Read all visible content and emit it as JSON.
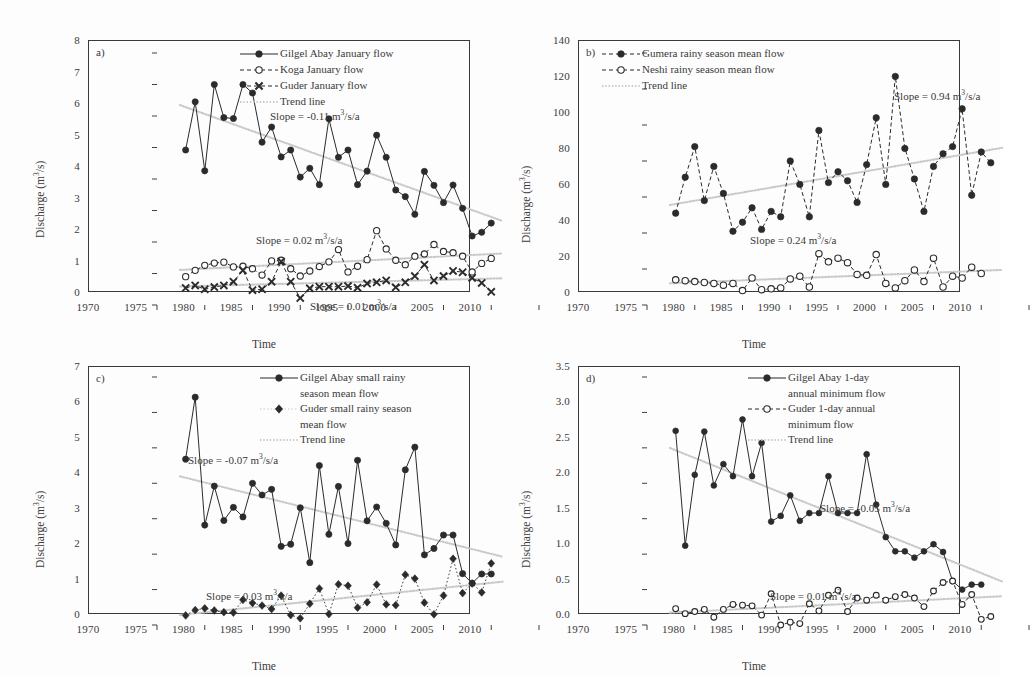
{
  "figure": {
    "background": "#ffffff",
    "ink": "#2b2b2b",
    "trend_color": "#c9c9c9"
  },
  "axis": {
    "xlabel": "Time",
    "ylabel": "Discharge (m3/s)",
    "ylabel_base": "Discharge (m",
    "ylabel_sup": "3",
    "ylabel_tail": "/s)",
    "xticks": [
      "1970",
      "1975",
      "1980",
      "1985",
      "1990",
      "1995",
      "2000",
      "2005",
      "2010"
    ],
    "xlim": [
      1970,
      2010
    ]
  },
  "panels": [
    {
      "id": "a",
      "letter": "a)",
      "ylim": [
        0,
        8
      ],
      "yticks": [
        "0",
        "1",
        "2",
        "3",
        "4",
        "5",
        "6",
        "7",
        "8"
      ],
      "legend": [
        {
          "label": "Gilgel Abay January flow",
          "key": "solid-filled-circle"
        },
        {
          "label": "Koga January flow",
          "key": "dashed-open-circle"
        },
        {
          "label": "Guder January flow",
          "key": "dashed-cross"
        },
        {
          "label": "Trend line",
          "key": "dotted-grey-line"
        }
      ],
      "annotations": [
        {
          "prefix": "Slope = -0.11 m",
          "sup": "3",
          "suffix": "/s/a",
          "x": 182,
          "y": 68
        },
        {
          "prefix": "Slope = 0.02 m",
          "sup": "3",
          "suffix": "/s/a",
          "x": 168,
          "y": 192
        },
        {
          "prefix": "Slope = 0.01 m",
          "sup": "3",
          "suffix": "/s/a",
          "x": 222,
          "y": 258
        }
      ]
    },
    {
      "id": "b",
      "letter": "b)",
      "ylim": [
        0,
        140
      ],
      "yticks": [
        "0",
        "20",
        "40",
        "60",
        "80",
        "100",
        "120",
        "140"
      ],
      "legend": [
        {
          "label": "Gumera rainy season mean flow",
          "key": "dashed-filled-circle"
        },
        {
          "label": "Neshi rainy season mean flow",
          "key": "dashed-open-circle"
        },
        {
          "label": "Trend line",
          "key": "dotted-grey-line"
        }
      ],
      "annotations": [
        {
          "prefix": "Slope = 0.94 m",
          "sup": "3",
          "suffix": "/s/a",
          "x": 316,
          "y": 48
        },
        {
          "prefix": "Slope = 0.24 m",
          "sup": "3",
          "suffix": "/s/a",
          "x": 172,
          "y": 192
        }
      ]
    },
    {
      "id": "c",
      "letter": "c)",
      "ylim": [
        0,
        7
      ],
      "yticks": [
        "0",
        "1",
        "2",
        "3",
        "4",
        "5",
        "6",
        "7"
      ],
      "legend": [
        {
          "label": "Gilgel Abay small rainy",
          "label2": "season mean flow",
          "key": "solid-filled-circle"
        },
        {
          "label": "Guder small rainy season",
          "label2": "mean flow",
          "key": "dotted-filled-diamond"
        },
        {
          "label": "Trend line",
          "key": "dotted-grey-line"
        }
      ],
      "annotations": [
        {
          "prefix": "Slope = -0.07 m",
          "sup": "3",
          "suffix": "/s/a",
          "x": 100,
          "y": 86
        },
        {
          "prefix": "Slope = 0.03 m",
          "sup": "3",
          "suffix": "/s/a",
          "x": 118,
          "y": 222
        }
      ]
    },
    {
      "id": "d",
      "letter": "d)",
      "ylim": [
        0,
        3.5
      ],
      "yticks": [
        "0.0",
        "0.5",
        "1.0",
        "1.5",
        "2.0",
        "2.5",
        "3.0",
        "3.5"
      ],
      "legend": [
        {
          "label": "Gilgel Abay 1-day",
          "label2": "annual minimum flow",
          "key": "solid-filled-circle"
        },
        {
          "label": "Guder 1-day annual",
          "label2": "minimum flow",
          "key": "dashed-open-circle"
        },
        {
          "label": "Trend line",
          "key": "dotted-grey-line"
        }
      ],
      "annotations": [
        {
          "prefix": "Slope = -0.05 m",
          "sup": "3",
          "suffix": "/s/a",
          "x": 242,
          "y": 134
        },
        {
          "prefix": "Slope = 0.01 m",
          "sup": "3",
          "suffix": "/s/a",
          "x": 192,
          "y": 222
        }
      ]
    }
  ],
  "chart_data": [
    {
      "panel": "a",
      "type": "line",
      "title": "a) January flow",
      "xlabel": "Time",
      "ylabel": "Discharge (m3/s)",
      "xlim": [
        1970,
        2010
      ],
      "ylim": [
        0,
        8
      ],
      "grid": false,
      "legend_position": "top-right",
      "x": [
        1973,
        1974,
        1975,
        1976,
        1977,
        1978,
        1979,
        1980,
        1981,
        1982,
        1983,
        1984,
        1985,
        1986,
        1987,
        1988,
        1989,
        1990,
        1991,
        1992,
        1993,
        1994,
        1995,
        1996,
        1997,
        1998,
        1999,
        2000,
        2001,
        2002,
        2003,
        2004,
        2005
      ],
      "series": [
        {
          "name": "Gilgel Abay January flow",
          "marker": "filled-circle",
          "line": "solid",
          "values": [
            4.92,
            6.45,
            4.26,
            7.0,
            5.95,
            5.92,
            7.0,
            6.73,
            5.17,
            5.65,
            4.7,
            4.92,
            4.06,
            4.34,
            3.82,
            5.91,
            4.69,
            4.92,
            3.82,
            4.25,
            5.39,
            4.69,
            3.65,
            3.44,
            2.88,
            4.24,
            3.8,
            3.25,
            3.81,
            3.07,
            2.19,
            2.31,
            2.6
          ],
          "trend_slope": -0.11,
          "trend_label": "Slope = -0.11 m3/s/a"
        },
        {
          "name": "Koga January flow",
          "marker": "open-circle",
          "line": "dashed",
          "values": [
            0.9,
            1.1,
            1.26,
            1.33,
            1.36,
            1.21,
            1.23,
            1.15,
            0.95,
            1.4,
            1.42,
            1.15,
            0.92,
            1.08,
            1.22,
            1.37,
            1.76,
            1.05,
            1.23,
            1.44,
            2.36,
            1.78,
            1.42,
            1.28,
            1.55,
            1.62,
            1.92,
            1.7,
            1.66,
            1.55,
            1.05,
            1.32,
            1.48
          ],
          "trend_slope": 0.02,
          "trend_label": "Slope = 0.02 m3/s/a"
        },
        {
          "name": "Guder January flow",
          "marker": "cross",
          "line": "dashed",
          "values": [
            0.54,
            0.62,
            0.5,
            0.57,
            0.62,
            0.74,
            1.1,
            0.47,
            0.5,
            0.74,
            1.38,
            0.74,
            0.22,
            0.53,
            0.58,
            0.58,
            0.58,
            0.6,
            0.55,
            0.68,
            0.72,
            0.78,
            0.56,
            0.72,
            0.92,
            1.28,
            0.78,
            0.92,
            1.08,
            1.04,
            0.86,
            0.7,
            0.42
          ],
          "trend_slope": 0.01,
          "trend_label": "Slope = 0.01 m3/s/a"
        }
      ]
    },
    {
      "panel": "b",
      "type": "line",
      "title": "b) Rainy season mean flow",
      "xlabel": "Time",
      "ylabel": "Discharge (m3/s)",
      "xlim": [
        1970,
        2010
      ],
      "ylim": [
        0,
        140
      ],
      "grid": false,
      "legend_position": "top-left",
      "x": [
        1973,
        1974,
        1975,
        1976,
        1977,
        1978,
        1979,
        1980,
        1981,
        1982,
        1983,
        1984,
        1985,
        1986,
        1987,
        1988,
        1989,
        1990,
        1991,
        1992,
        1993,
        1994,
        1995,
        1996,
        1997,
        1998,
        1999,
        2000,
        2001,
        2002,
        2003,
        2004,
        2005,
        2006
      ],
      "series": [
        {
          "name": "Gumera rainy season mean flow",
          "marker": "filled-circle",
          "line": "dashed",
          "values": [
            51,
            71,
            88,
            58,
            77,
            62,
            41,
            46,
            54,
            42,
            52,
            49,
            80,
            67,
            49,
            97,
            68,
            74,
            69,
            57,
            78,
            104,
            67,
            127,
            87,
            70,
            52,
            77,
            84,
            88,
            109,
            61,
            85,
            79
          ],
          "trend_slope": 0.94,
          "trend_label": "Slope = 0.94 m3/s/a"
        },
        {
          "name": "Neshi rainy season mean flow",
          "marker": "open-circle",
          "line": "dashed",
          "values": [
            14,
            13.5,
            13,
            12.5,
            12,
            11,
            12,
            8,
            15,
            8.5,
            9,
            9.5,
            14.5,
            16,
            10,
            28.5,
            24,
            26,
            23.5,
            17,
            16.5,
            28,
            12,
            9.5,
            13.5,
            19.5,
            13,
            26,
            10,
            16,
            15,
            21,
            17.5,
            null
          ],
          "trend_slope": 0.24,
          "trend_label": "Slope = 0.24 m3/s/a"
        }
      ]
    },
    {
      "panel": "c",
      "type": "line",
      "title": "c) Small rainy season mean flow",
      "xlabel": "Time",
      "ylabel": "Discharge (m3/s)",
      "xlim": [
        1970,
        2010
      ],
      "ylim": [
        0,
        7
      ],
      "grid": false,
      "legend_position": "top-right",
      "x": [
        1973,
        1974,
        1975,
        1976,
        1977,
        1978,
        1979,
        1980,
        1981,
        1982,
        1983,
        1984,
        1985,
        1986,
        1987,
        1988,
        1989,
        1990,
        1991,
        1992,
        1993,
        1994,
        1995,
        1996,
        1997,
        1998,
        1999,
        2000,
        2001,
        2002,
        2003,
        2004,
        2005
      ],
      "series": [
        {
          "name": "Gilgel Abay small rainy season mean flow",
          "marker": "filled-circle",
          "line": "solid",
          "values": [
            4.68,
            6.43,
            2.82,
            3.92,
            2.95,
            3.32,
            3.05,
            4.0,
            3.67,
            3.83,
            2.22,
            2.28,
            3.31,
            1.76,
            4.5,
            2.56,
            3.91,
            2.3,
            4.65,
            2.94,
            3.33,
            2.87,
            2.26,
            4.38,
            5.02,
            1.98,
            2.16,
            2.54,
            2.54,
            1.45,
            1.18,
            1.44,
            1.44
          ],
          "trend_slope": -0.07,
          "trend_label": "Slope = -0.07 m3/s/a"
        },
        {
          "name": "Guder small rainy season mean flow",
          "marker": "filled-diamond",
          "line": "dotted",
          "values": [
            0.27,
            0.42,
            0.47,
            0.41,
            0.36,
            0.35,
            0.71,
            0.62,
            0.55,
            0.45,
            0.83,
            0.28,
            0.19,
            0.6,
            1.03,
            0.31,
            1.15,
            1.11,
            0.49,
            0.64,
            1.14,
            0.58,
            0.56,
            1.42,
            1.31,
            0.63,
            0.3,
            0.83,
            1.87,
            0.9,
            1.17,
            0.92,
            1.74
          ],
          "trend_slope": 0.03,
          "trend_label": "Slope = 0.03 m3/s/a"
        }
      ]
    },
    {
      "panel": "d",
      "type": "line",
      "title": "d) 1-day annual minimum flow",
      "xlabel": "Time",
      "ylabel": "Discharge (m3/s)",
      "xlim": [
        1970,
        2010
      ],
      "ylim": [
        0,
        3.5
      ],
      "grid": false,
      "legend_position": "top-right",
      "x": [
        1973,
        1974,
        1975,
        1976,
        1977,
        1978,
        1979,
        1980,
        1981,
        1982,
        1983,
        1984,
        1985,
        1986,
        1987,
        1988,
        1989,
        1990,
        1991,
        1992,
        1993,
        1994,
        1995,
        1996,
        1997,
        1998,
        1999,
        2000,
        2001,
        2002,
        2003,
        2004,
        2005,
        2006
      ],
      "series": [
        {
          "name": "Gilgel Abay 1-day annual minimum flow",
          "marker": "filled-circle",
          "line": "solid",
          "values": [
            2.74,
            1.12,
            2.12,
            2.73,
            1.97,
            2.27,
            2.1,
            2.9,
            2.1,
            2.57,
            1.46,
            1.54,
            1.83,
            1.47,
            1.58,
            1.58,
            2.1,
            1.58,
            1.58,
            1.58,
            2.41,
            1.7,
            1.24,
            1.04,
            1.04,
            0.95,
            1.04,
            1.14,
            1.03,
            0.62,
            0.5,
            0.57,
            0.57,
            null
          ],
          "trend_slope": -0.05,
          "trend_label": "Slope = -0.05 m3/s/a"
        },
        {
          "name": "Guder 1-day annual minimum flow",
          "marker": "open-circle",
          "line": "dashed",
          "values": [
            0.23,
            0.16,
            0.19,
            0.22,
            0.11,
            0.22,
            0.29,
            0.28,
            0.27,
            0.14,
            0.44,
            0.0,
            0.04,
            0.02,
            0.3,
            0.2,
            0.42,
            0.49,
            0.19,
            0.38,
            0.35,
            0.42,
            0.35,
            0.4,
            0.43,
            0.38,
            0.26,
            0.48,
            0.6,
            0.62,
            0.29,
            0.43,
            0.08,
            0.12
          ],
          "trend_slope": 0.01,
          "trend_label": "Slope = 0.01 m3/s/a"
        }
      ]
    }
  ]
}
